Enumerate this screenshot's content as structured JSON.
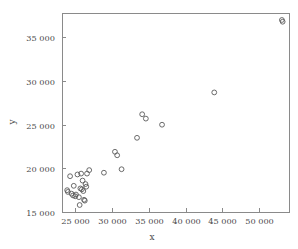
{
  "chart_data": {
    "type": "scatter",
    "title": "",
    "xlabel": "x",
    "ylabel": "y",
    "xlim": [
      23200,
      54200
    ],
    "ylim": [
      15000,
      37800
    ],
    "grid": false,
    "legend": null,
    "xticks": [
      25000,
      30000,
      35000,
      40000,
      45000,
      50000
    ],
    "yticks": [
      15000,
      20000,
      25000,
      30000,
      35000
    ],
    "xticklabels": [
      "25 000",
      "30 000",
      "35 000",
      "40 000",
      "45 000",
      "50 000"
    ],
    "yticklabels": [
      "15 000",
      "20 000",
      "25 000",
      "30 000",
      "35 000"
    ],
    "marker": "open-circle",
    "marker_color": "#5a5a5a",
    "series": [
      {
        "name": "observations",
        "points": [
          [
            23900,
            17500
          ],
          [
            24000,
            17300
          ],
          [
            24300,
            19100
          ],
          [
            24500,
            17100
          ],
          [
            24700,
            16900
          ],
          [
            24800,
            18000
          ],
          [
            25000,
            16800
          ],
          [
            25100,
            17000
          ],
          [
            25300,
            19300
          ],
          [
            25500,
            16700
          ],
          [
            25600,
            15800
          ],
          [
            25700,
            17700
          ],
          [
            25800,
            19400
          ],
          [
            25900,
            17600
          ],
          [
            26000,
            18600
          ],
          [
            26100,
            17400
          ],
          [
            26200,
            16400
          ],
          [
            26300,
            16300
          ],
          [
            26400,
            18200
          ],
          [
            26500,
            17900
          ],
          [
            26600,
            19400
          ],
          [
            26900,
            19800
          ],
          [
            28900,
            19500
          ],
          [
            30400,
            21900
          ],
          [
            30700,
            21500
          ],
          [
            31300,
            19900
          ],
          [
            33400,
            23500
          ],
          [
            34100,
            26200
          ],
          [
            34600,
            25700
          ],
          [
            36800,
            25000
          ],
          [
            43900,
            28700
          ],
          [
            53100,
            37000
          ],
          [
            53200,
            36800
          ]
        ]
      }
    ]
  },
  "axis": {
    "x_title": "x",
    "y_title": "y"
  },
  "frame": {
    "left_px": 62,
    "right_px": 290,
    "top_px": 13,
    "bottom_px": 212
  }
}
